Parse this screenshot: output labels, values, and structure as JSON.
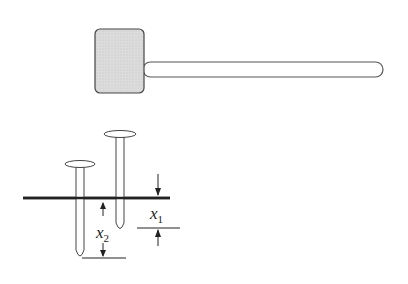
{
  "diagram": {
    "title": "",
    "hammer": {
      "head_fill": "#d9d9d9",
      "stroke": "#444444"
    },
    "ground_line_color": "#222222",
    "labels": {
      "x1": {
        "base": "x",
        "sub": "1"
      },
      "x2": {
        "base": "x",
        "sub": "2"
      }
    }
  }
}
